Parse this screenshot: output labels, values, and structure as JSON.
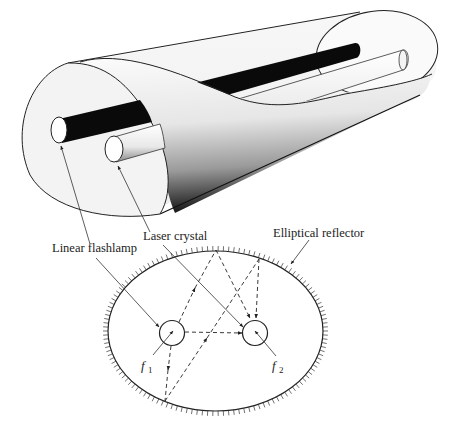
{
  "figure": {
    "labels": {
      "flashlamp": "Linear flashlamp",
      "crystal": "Laser crystal",
      "reflector": "Elliptical reflector",
      "focus1": "f",
      "focus1_sub": "1",
      "focus2": "f",
      "focus2_sub": "2"
    },
    "colors": {
      "line": "#222222",
      "flashlamp_rod": "#0a0a0a",
      "crystal_rod": "#f4f4f4",
      "background": "#ffffff"
    }
  }
}
